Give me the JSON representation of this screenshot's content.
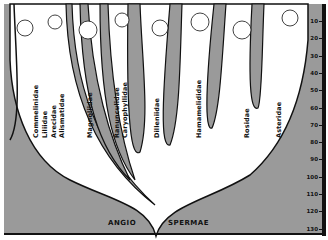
{
  "diagram": {
    "title_left": "ANGIO",
    "title_right": "SPERMAE",
    "taxa": [
      {
        "label": "Commelinidae",
        "x": 32
      },
      {
        "label": "Liliidae",
        "x": 41
      },
      {
        "label": "Arecidae",
        "x": 50
      },
      {
        "label": "Alismatidae",
        "x": 58
      },
      {
        "label": "Magnoliidae",
        "x": 86
      },
      {
        "label": "Ranunculidae",
        "x": 113
      },
      {
        "label": "Caryophyllidae",
        "x": 121
      },
      {
        "label": "Dilleniidae",
        "x": 153
      },
      {
        "label": "Hamamelididae",
        "x": 195
      },
      {
        "label": "Rosidae",
        "x": 243
      },
      {
        "label": "Asteridae",
        "x": 275
      }
    ],
    "scale": {
      "ticks": [
        "10",
        "20",
        "30",
        "40",
        "50",
        "60",
        "70",
        "80",
        "90",
        "100",
        "110",
        "120",
        "130"
      ]
    },
    "colors": {
      "fill": "#9a9a9a",
      "line": "#111111",
      "bg": "#ffffff"
    }
  }
}
